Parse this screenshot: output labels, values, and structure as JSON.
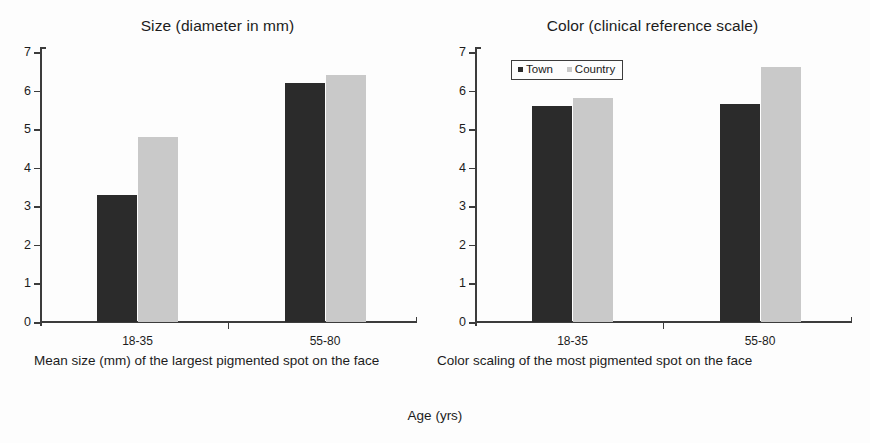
{
  "figure": {
    "x_axis_caption": "Age (yrs)"
  },
  "legend": {
    "items": [
      {
        "label": "Town",
        "color": "#2b2b2b",
        "icon": "square-marker-icon"
      },
      {
        "label": "Country",
        "color": "#c9c9c9",
        "icon": "square-marker-icon"
      }
    ]
  },
  "panels": [
    {
      "title": "Size (diameter in mm)",
      "caption": "Mean size (mm) of the largest pigmented spot on the face"
    },
    {
      "title": "Color (clinical reference scale)",
      "caption": "Color scaling of the most pigmented spot on the face"
    }
  ],
  "chart_data": [
    {
      "type": "bar",
      "title": "Size (diameter in mm)",
      "subtitle": "Mean size (mm) of the largest pigmented spot on the face",
      "xlabel": "Age (yrs)",
      "ylabel": "",
      "ylim": [
        0,
        7
      ],
      "yticks": [
        0,
        1,
        2,
        3,
        4,
        5,
        6,
        7
      ],
      "grid": false,
      "legend_position": "none",
      "categories": [
        "18-35",
        "55-80"
      ],
      "series": [
        {
          "name": "Town",
          "color": "#2b2b2b",
          "values": [
            3.3,
            6.2
          ]
        },
        {
          "name": "Country",
          "color": "#c9c9c9",
          "values": [
            4.8,
            6.4
          ]
        }
      ]
    },
    {
      "type": "bar",
      "title": "Color (clinical reference scale)",
      "subtitle": "Color scaling of the most pigmented spot on the face",
      "xlabel": "Age (yrs)",
      "ylabel": "",
      "ylim": [
        0,
        7
      ],
      "yticks": [
        0,
        1,
        2,
        3,
        4,
        5,
        6,
        7
      ],
      "grid": false,
      "legend_position": "top-left",
      "categories": [
        "18-35",
        "55-80"
      ],
      "series": [
        {
          "name": "Town",
          "color": "#2b2b2b",
          "values": [
            5.6,
            5.65
          ]
        },
        {
          "name": "Country",
          "color": "#c9c9c9",
          "values": [
            5.8,
            6.6
          ]
        }
      ]
    }
  ]
}
